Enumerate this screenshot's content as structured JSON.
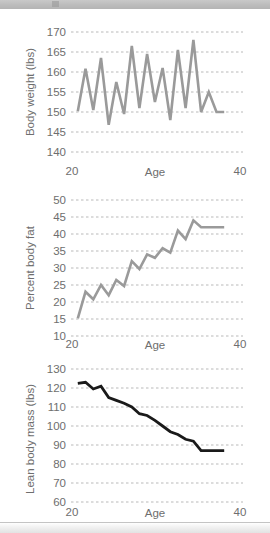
{
  "window": {
    "top_bar_name": "scroll-toolbar",
    "bottom_bar_name": "status-bar"
  },
  "figure": {
    "panels": [
      "body-weight",
      "percent-body-fat",
      "lean-body-mass"
    ]
  },
  "chart_data": [
    {
      "type": "line",
      "title": "",
      "panel_label": "A",
      "xlabel": "Age",
      "ylabel": "Body weight (lbs)",
      "xlim": [
        20,
        40
      ],
      "ylim": [
        140,
        170
      ],
      "xticks": [
        20,
        40
      ],
      "yticks": [
        140,
        145,
        150,
        155,
        160,
        165,
        170
      ],
      "grid": true,
      "line_color": "#9a9a9a",
      "x": [
        20.5,
        21.5,
        22.5,
        23.5,
        24.5,
        25.5,
        26.5,
        27.5,
        28.5,
        29.5,
        30.5,
        31.5,
        32.5,
        33.5,
        34.5,
        35.5,
        36.5,
        37.5,
        38.5,
        39.5
      ],
      "values": [
        150.2,
        160.8,
        150.5,
        163.5,
        146.8,
        157.5,
        149.5,
        166.5,
        151.0,
        164.5,
        152.5,
        161.0,
        148.0,
        165.5,
        151.0,
        168.0,
        150.0,
        155.0,
        150.0,
        150.0
      ]
    },
    {
      "type": "line",
      "title": "",
      "panel_label": "B",
      "xlabel": "Age",
      "ylabel": "Percent body fat",
      "xlim": [
        20,
        40
      ],
      "ylim": [
        10,
        50
      ],
      "xticks": [
        20,
        40
      ],
      "yticks": [
        10,
        15,
        20,
        25,
        30,
        35,
        40,
        45,
        50
      ],
      "grid": true,
      "line_color": "#9a9a9a",
      "x": [
        20.5,
        21.5,
        22.5,
        23.5,
        24.5,
        25.5,
        26.5,
        27.5,
        28.5,
        29.5,
        30.5,
        31.5,
        32.5,
        33.5,
        34.5,
        35.5,
        36.5,
        37.5,
        38.5,
        39.5
      ],
      "values": [
        15.2,
        23.0,
        20.8,
        25.0,
        22.0,
        26.5,
        24.7,
        32.0,
        29.7,
        34.0,
        33.0,
        35.8,
        34.5,
        41.0,
        38.5,
        44.0,
        42.0,
        42.0,
        42.0,
        42.0
      ]
    },
    {
      "type": "line",
      "title": "",
      "panel_label": "C",
      "xlabel": "Age",
      "ylabel": "Lean body mass (lbs)",
      "xlim": [
        20,
        40
      ],
      "ylim": [
        60,
        130
      ],
      "xticks": [
        20,
        40
      ],
      "yticks": [
        60,
        70,
        80,
        90,
        100,
        110,
        120,
        130
      ],
      "grid": true,
      "line_color": "#1a1a1a",
      "x": [
        20.5,
        21.5,
        22.5,
        23.5,
        24.5,
        25.5,
        26.5,
        27.5,
        28.5,
        29.5,
        30.5,
        31.5,
        32.5,
        33.5,
        34.5,
        35.5,
        36.5,
        37.5,
        38.5,
        39.5
      ],
      "values": [
        122.5,
        123.0,
        119.5,
        121.0,
        115.0,
        113.5,
        112.0,
        110.0,
        106.5,
        105.5,
        103.0,
        100.0,
        97.0,
        95.5,
        93.0,
        92.0,
        87.0,
        87.0,
        87.0,
        87.0
      ]
    }
  ]
}
